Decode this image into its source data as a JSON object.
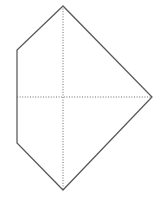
{
  "figure": {
    "name": "hexagonal-kite-diagram",
    "canvas": {
      "width": 162,
      "height": 199,
      "background_color": "#ffffff"
    },
    "outline": {
      "stroke_color": "#58585a",
      "stroke_width": 1.25,
      "closed": true,
      "points": [
        {
          "label": "top-apex",
          "x": 63,
          "y": 6
        },
        {
          "label": "upper-left",
          "x": 17,
          "y": 50
        },
        {
          "label": "lower-left",
          "x": 17,
          "y": 143
        },
        {
          "label": "bottom-apex",
          "x": 63,
          "y": 190
        },
        {
          "label": "right-apex",
          "x": 152,
          "y": 97
        }
      ],
      "path": "M 63 6 L 17 50 L 17 143 L 63 190 L 152 97 Z"
    },
    "axes": [
      {
        "label": "vertical-axis",
        "orientation": "vertical",
        "stroke_color": "#6b6b6d",
        "dash_pattern": "1 1.6",
        "x1": 63,
        "y1": 6,
        "x2": 63,
        "y2": 190
      },
      {
        "label": "horizontal-axis",
        "orientation": "horizontal",
        "stroke_color": "#6b6b6d",
        "dash_pattern": "1 1.6",
        "x1": 17,
        "y1": 97,
        "x2": 152,
        "y2": 97
      }
    ],
    "intersection": {
      "label": "center",
      "x": 63,
      "y": 97
    }
  }
}
